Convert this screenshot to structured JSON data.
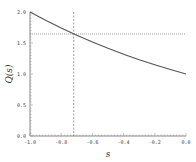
{
  "chart_data": {
    "type": "line",
    "title": "",
    "xlabel": "s",
    "ylabel": "Q(s)",
    "xlim": [
      -1.0,
      0.0
    ],
    "ylim": [
      0.0,
      2.0
    ],
    "x_ticks": [
      "-1.0",
      "-0.8",
      "-0.6",
      "-0.4",
      "-0.2",
      "0.0"
    ],
    "y_ticks": [
      "0.0",
      "0.5",
      "1.0",
      "1.5",
      "2.0"
    ],
    "grid": false,
    "legend": null,
    "series": [
      {
        "name": "Q(s)",
        "x": [
          -1.0,
          -0.9,
          -0.8,
          -0.7,
          -0.6,
          -0.5,
          -0.4,
          -0.3,
          -0.2,
          -0.1,
          0.0
        ],
        "y": [
          2.0,
          1.866,
          1.741,
          1.625,
          1.516,
          1.414,
          1.32,
          1.231,
          1.149,
          1.072,
          1.0
        ],
        "style": "solid",
        "color": "#555555"
      }
    ],
    "annotations": [
      {
        "type": "vline",
        "x": -0.72,
        "style": "dashed",
        "color": "#777777"
      },
      {
        "type": "hline",
        "y": 1.645,
        "style": "dotted",
        "color": "#777777"
      }
    ]
  }
}
